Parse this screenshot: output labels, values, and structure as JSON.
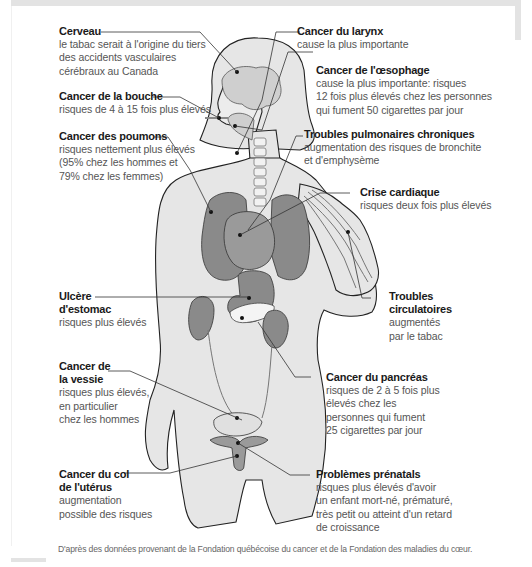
{
  "figure": {
    "colors": {
      "skin": "#e6e6e6",
      "organ": "#8a8a8a",
      "organ_light": "#b5b5b5",
      "outline": "#222222",
      "leader_line": "#333333",
      "title_text": "#1a1a1a",
      "desc_text": "#555555"
    }
  },
  "labels": [
    {
      "id": "cerveau",
      "title": "Cerveau",
      "desc": "le tabac serait à l'origine du tiers\ndes accidents vasculaires\ncérébraux au Canada"
    },
    {
      "id": "bouche",
      "title": "Cancer de la bouche",
      "desc": "risques de 4 à 15 fois plus élevés"
    },
    {
      "id": "poumons",
      "title": "Cancer des poumons",
      "desc": "risques nettement plus élevés\n(95% chez les hommes et\n79% chez les femmes)"
    },
    {
      "id": "larynx",
      "title": "Cancer du larynx",
      "desc": "cause la plus importante"
    },
    {
      "id": "oesophage",
      "title": "Cancer de l'œsophage",
      "desc": "cause la plus importante: risques\n12 fois plus élevés chez les personnes\nqui fument 50 cigarettes par jour"
    },
    {
      "id": "pulmonaires",
      "title": "Troubles pulmonaires chroniques",
      "desc": "augmentation des risques de bronchite\net d'emphysème"
    },
    {
      "id": "cardiaque",
      "title": "Crise cardiaque",
      "desc": "risques deux fois plus élevés"
    },
    {
      "id": "ulcere",
      "title": "Ulcère\nd'estomac",
      "desc": "risques plus élevés"
    },
    {
      "id": "circulatoires",
      "title": "Troubles\ncirculatoires",
      "desc": "augmentés\npar le tabac"
    },
    {
      "id": "vessie",
      "title": "Cancer de\nla vessie",
      "desc": "risques plus élevés,\nen particulier\nchez les hommes"
    },
    {
      "id": "pancreas",
      "title": "Cancer du pancréas",
      "desc": "risques de 2 à 5 fois plus\nélevés chez les\npersonnes qui fument\n25 cigarettes par jour"
    },
    {
      "id": "uterus",
      "title": "Cancer du col\nde l'utérus",
      "desc": "augmentation\npossible des risques"
    },
    {
      "id": "prenatals",
      "title": "Problèmes prénatals",
      "desc": "risques plus élevés d'avoir\nun enfant mort-né, prématuré,\ntrès petit ou atteint d'un retard\nde croissance"
    }
  ],
  "footer": {
    "source": "D'après des données provenant de la Fondation québécoise du cancer et de la Fondation des maladies du cœur."
  }
}
